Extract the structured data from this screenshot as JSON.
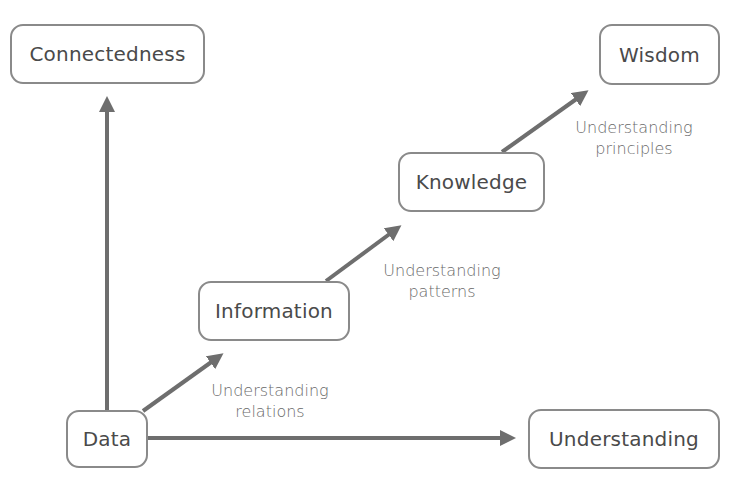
{
  "diagram": {
    "top_clipped_text": "Understanding principles leads to wisdom through knowledge and patterns",
    "nodes": {
      "connectedness": "Connectedness",
      "wisdom": "Wisdom",
      "knowledge": "Knowledge",
      "information": "Information",
      "data": "Data",
      "understanding": "Understanding"
    },
    "edge_labels": {
      "relations_line1": "Understanding",
      "relations_line2": "relations",
      "patterns_line1": "Understanding",
      "patterns_line2": "patterns",
      "principles_line1": "Understanding",
      "principles_line2": "principles"
    },
    "colors": {
      "arrow": "#6e6e6e",
      "node_border": "#8a8a8a",
      "text": "#4a4a4a",
      "label_text": "#6a6a6a"
    }
  }
}
